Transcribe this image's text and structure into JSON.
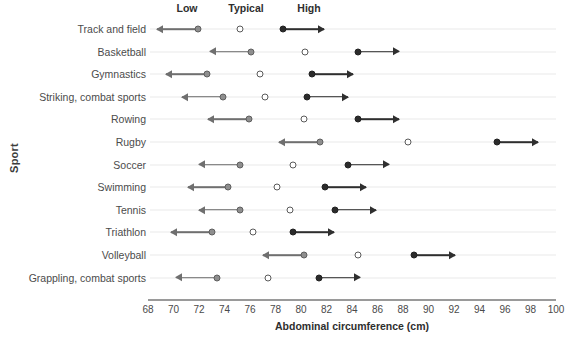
{
  "chart_data": {
    "type": "scatter",
    "title": "",
    "xlabel": "Abdominal circumference (cm)",
    "ylabel": "Sport",
    "xlim": [
      68,
      100
    ],
    "xticks": [
      68,
      70,
      72,
      74,
      76,
      78,
      80,
      82,
      84,
      86,
      88,
      90,
      92,
      94,
      96,
      98,
      100
    ],
    "grid": true,
    "legend_position": "top",
    "series_labels": [
      "Low",
      "Typical",
      "High"
    ],
    "categories": [
      "Track and field",
      "Basketball",
      "Gymnastics",
      "Striking, combat sports",
      "Rowing",
      "Rugby",
      "Soccer",
      "Swimming",
      "Tennis",
      "Triathlon",
      "Volleyball",
      "Grappling, combat sports"
    ],
    "series": [
      {
        "name": "Low",
        "values": [
          71.9,
          76.1,
          72.6,
          73.9,
          75.9,
          81.5,
          75.2,
          74.3,
          75.2,
          73.0,
          80.2,
          73.4
        ]
      },
      {
        "name": "Typical",
        "values": [
          75.2,
          80.3,
          76.8,
          77.2,
          80.2,
          88.4,
          79.4,
          78.1,
          79.1,
          76.2,
          84.5,
          77.4
        ]
      },
      {
        "name": "High",
        "values": [
          78.6,
          84.5,
          80.9,
          80.5,
          84.5,
          95.4,
          83.7,
          81.9,
          82.7,
          79.4,
          88.9,
          81.4
        ]
      }
    ],
    "arrow_extent_cm": 3.2,
    "colors": {
      "low_marker": "#8e8e8e",
      "typical_marker": "#ffffff",
      "high_marker": "#2b2b2b",
      "low_arrow": "#6f6f6f",
      "high_arrow": "#2f2f2f",
      "gridline": "#e9e9e9",
      "axis": "#9a9a9a"
    }
  },
  "header_labels": {
    "low": "Low",
    "typical": "Typical",
    "high": "High"
  }
}
